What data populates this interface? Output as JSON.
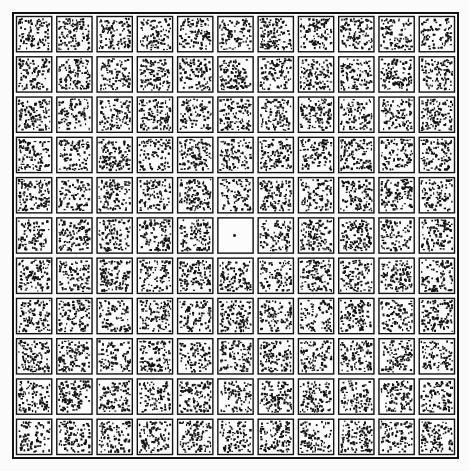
{
  "figure": {
    "kind": "dot-texture-grid",
    "background_color": "#fbfbfb",
    "ink_color": "#121212",
    "cell_fill_color": "#fcfcfc"
  },
  "grid": {
    "rows": 11,
    "columns": 11,
    "total_cells": 121,
    "origin_x": 12,
    "origin_y": 12,
    "width": 447,
    "height": 447,
    "cell_pitch": 40.6,
    "cell_size": 37,
    "cell_gap": 3.6,
    "cell_border_width": 1.4,
    "outer_frame_width": 2
  },
  "texture": {
    "dots_per_cell_min": 78,
    "dots_per_cell_max": 122,
    "dot_size_min": 1.1,
    "dot_size_max": 2.6,
    "dot_color": "#121212",
    "distribution": "uniform-random",
    "random_seed": 20240617
  },
  "target": {
    "label": "blank-cell-with-single-dot",
    "row": 6,
    "column": 6,
    "row_index": 5,
    "column_index": 5,
    "position": "center",
    "dot_count": 1,
    "dot_offset_x": 0.47,
    "dot_offset_y": 0.5,
    "dot_size": 2.6
  },
  "chart_data": {
    "type": "heatmap",
    "title": "",
    "xlabel": "",
    "ylabel": "",
    "grid": true,
    "legend": "none",
    "rows": 11,
    "columns": 11,
    "value_label": "dot count per cell",
    "note": "Each cell value is the number of random dots rendered inside that cell. The center cell (row 6, column 6) contains a single dot and is the pop-out target.",
    "values": [
      [
        96,
        104,
        110,
        88,
        101,
        93,
        115,
        99,
        107,
        91,
        86
      ],
      [
        92,
        118,
        85,
        106,
        97,
        112,
        90,
        103,
        94,
        109,
        100
      ],
      [
        108,
        87,
        99,
        113,
        91,
        105,
        98,
        116,
        89,
        95,
        111
      ],
      [
        101,
        94,
        117,
        86,
        108,
        92,
        104,
        97,
        112,
        88,
        106
      ],
      [
        115,
        90,
        102,
        96,
        119,
        87,
        110,
        93,
        100,
        114,
        91
      ],
      [
        89,
        107,
        98,
        112,
        103,
        1,
        95,
        109,
        116,
        85,
        99
      ],
      [
        104,
        96,
        121,
        90,
        113,
        100,
        88,
        106,
        92,
        111,
        97
      ],
      [
        93,
        110,
        87,
        105,
        98,
        117,
        101,
        84,
        108,
        94,
        115
      ],
      [
        112,
        99,
        91,
        118,
        86,
        109,
        103,
        95,
        113,
        100,
        88
      ],
      [
        97,
        114,
        106,
        92,
        110,
        85,
        116,
        102,
        90,
        107,
        98
      ],
      [
        85,
        100,
        93,
        109,
        104,
        96,
        111,
        89,
        118,
        87,
        103
      ]
    ]
  }
}
